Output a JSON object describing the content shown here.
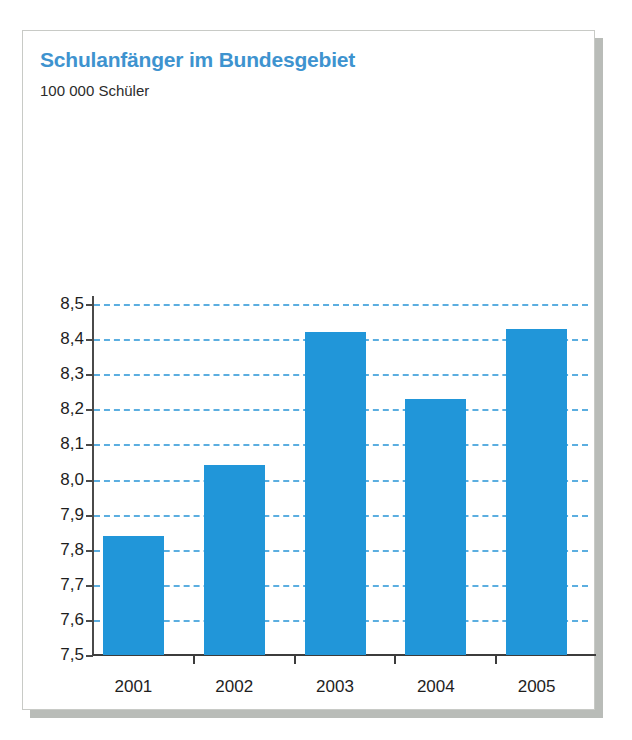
{
  "card": {
    "title": "Schulanfänger im Bundesgebiet",
    "subtitle": "100 000 Schüler",
    "title_color": "#3e93cf",
    "bar_color": "#2196d9",
    "gridline_color": "#5baee0",
    "axis_color": "#3c3c3c",
    "border_color": "#c8cac6",
    "shadow_color": "#b9bcb8"
  },
  "chart_data": {
    "type": "bar",
    "title": "Schulanfänger im Bundesgebiet",
    "subtitle": "100 000 Schüler",
    "xlabel": "",
    "ylabel": "100 000 Schüler",
    "categories": [
      "2001",
      "2002",
      "2003",
      "2004",
      "2005"
    ],
    "values": [
      7.84,
      8.04,
      8.42,
      8.23,
      8.43
    ],
    "ylim": [
      7.5,
      8.5
    ],
    "ytick_step": 0.1,
    "ytick_labels": [
      "8,5",
      "8,4",
      "8,3",
      "8,2",
      "8,1",
      "8,0",
      "7,9",
      "7,8",
      "7,7",
      "7,6",
      "7,5"
    ],
    "ytick_values": [
      8.5,
      8.4,
      8.3,
      8.2,
      8.1,
      8.0,
      7.9,
      7.8,
      7.7,
      7.6,
      7.5
    ],
    "grid": true,
    "grid_style": "dashed",
    "legend": false,
    "series": [
      {
        "name": "Schulanfänger",
        "values": [
          7.84,
          8.04,
          8.42,
          8.23,
          8.43
        ]
      }
    ]
  }
}
